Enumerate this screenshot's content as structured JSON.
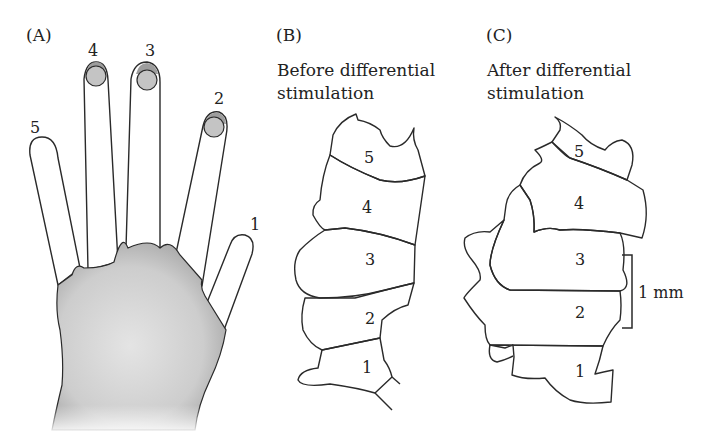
{
  "panels": {
    "a": {
      "letter": "(A)",
      "fingers": [
        {
          "num": "1",
          "name": "thumb"
        },
        {
          "num": "2",
          "name": "index"
        },
        {
          "num": "3",
          "name": "middle"
        },
        {
          "num": "4",
          "name": "ring"
        },
        {
          "num": "5",
          "name": "little"
        }
      ]
    },
    "b": {
      "letter": "(B)",
      "title_line1": "Before differential",
      "title_line2": "stimulation",
      "regions": [
        "5",
        "4",
        "3",
        "2",
        "1"
      ]
    },
    "c": {
      "letter": "(C)",
      "title_line1": "After differential",
      "title_line2": "stimulation",
      "regions": [
        "5",
        "4",
        "3",
        "2",
        "1"
      ],
      "scale_bar": "1 mm"
    }
  },
  "colors": {
    "light_region": "#d9d9d9",
    "dark_region": "#a9a9a9",
    "hand_fill": "#cfcfcf",
    "stimulated_tip": "#9d9d9d",
    "outline": "#2a2a2a"
  }
}
